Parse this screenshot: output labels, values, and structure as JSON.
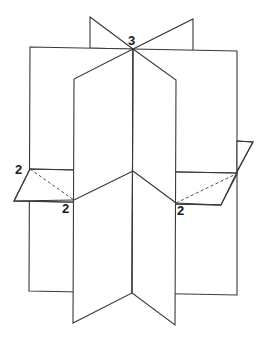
{
  "diagram": {
    "labels": {
      "top": "3",
      "left": "2",
      "bottom_left": "2",
      "bottom_right": "2"
    },
    "colors": {
      "line": "#3a3a3a",
      "text": "#1a1a1a",
      "background": "#ffffff"
    }
  }
}
